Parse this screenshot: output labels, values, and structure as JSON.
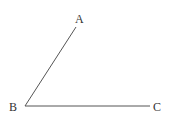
{
  "diagram": {
    "type": "angle",
    "points": [
      {
        "id": "A",
        "label": "A",
        "x": 76,
        "y": 27,
        "label_x": 75,
        "label_y": 23
      },
      {
        "id": "B",
        "label": "B",
        "x": 25,
        "y": 106,
        "label_x": 9,
        "label_y": 111
      },
      {
        "id": "C",
        "label": "C",
        "x": 150,
        "y": 106,
        "label_x": 153,
        "label_y": 111
      }
    ],
    "segments": [
      {
        "from": "B",
        "to": "A"
      },
      {
        "from": "B",
        "to": "C"
      }
    ],
    "colors": {
      "line": "#555555",
      "text": "#333333",
      "background": "#ffffff"
    }
  }
}
